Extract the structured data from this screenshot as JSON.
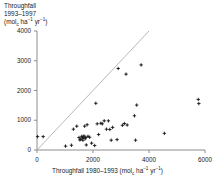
{
  "figure": {
    "name": "throughfall-scatter-plot",
    "background": "#ffffff",
    "axis_color": "#8c8c8c",
    "point_color": "#1a1a1a",
    "line_color": "#b0b0b0"
  },
  "labels": {
    "y_axis_line1": "Throughfall",
    "y_axis_line2": "1993–1997",
    "y_axis_units_pre": "(mol",
    "y_axis_units_sub": "c",
    "y_axis_units_mid": " ha",
    "y_axis_units_sup1": "−1",
    "y_axis_units_mid2": " yr",
    "y_axis_units_sup2": "−1",
    "y_axis_units_post": ")",
    "x_axis_pre": "Throughfall 1980–1993 (mol",
    "x_axis_sub": "c",
    "x_axis_mid": " ha",
    "x_axis_sup1": "−1",
    "x_axis_mid2": " yr",
    "x_axis_sup2": "−1",
    "x_axis_post": ")"
  },
  "ticks": {
    "y": [
      "0",
      "1000",
      "2000",
      "3000",
      "4000"
    ],
    "x": [
      "0",
      "2000",
      "4000",
      "6000"
    ]
  },
  "chart_data": {
    "type": "scatter",
    "title": "",
    "xlabel": "Throughfall 1980–1993 (mol_c ha^-1 yr^-1)",
    "ylabel": "Throughfall 1993–1997 (mol_c ha^-1 yr^-1)",
    "xlim": [
      0,
      6000
    ],
    "ylim": [
      0,
      4000
    ],
    "xticks": [
      0,
      2000,
      4000,
      6000
    ],
    "yticks": [
      0,
      1000,
      2000,
      3000,
      4000
    ],
    "grid": false,
    "legend": false,
    "reference_line": {
      "name": "one-to-one-line",
      "type": "identity",
      "from": [
        0,
        0
      ],
      "to": [
        4000,
        4000
      ]
    },
    "series": [
      {
        "name": "plots",
        "marker": "plus",
        "color": "#1a1a1a",
        "points": [
          [
            20,
            450
          ],
          [
            220,
            450
          ],
          [
            1020,
            130
          ],
          [
            1230,
            160
          ],
          [
            1300,
            700
          ],
          [
            1420,
            800
          ],
          [
            1500,
            420
          ],
          [
            1530,
            340
          ],
          [
            1560,
            360
          ],
          [
            1600,
            460
          ],
          [
            1620,
            400
          ],
          [
            1640,
            330
          ],
          [
            1660,
            430
          ],
          [
            1680,
            470
          ],
          [
            1700,
            800
          ],
          [
            1720,
            380
          ],
          [
            1740,
            420
          ],
          [
            1760,
            170
          ],
          [
            1790,
            850
          ],
          [
            1820,
            460
          ],
          [
            1880,
            430
          ],
          [
            1950,
            230
          ],
          [
            2060,
            150
          ],
          [
            2100,
            1570
          ],
          [
            2150,
            880
          ],
          [
            2200,
            520
          ],
          [
            2280,
            900
          ],
          [
            2330,
            880
          ],
          [
            2400,
            980
          ],
          [
            2480,
            700
          ],
          [
            2550,
            980
          ],
          [
            2600,
            690
          ],
          [
            2650,
            330
          ],
          [
            2700,
            760
          ],
          [
            2860,
            350
          ],
          [
            2900,
            2740
          ],
          [
            3050,
            830
          ],
          [
            3120,
            890
          ],
          [
            3180,
            2550
          ],
          [
            3220,
            840
          ],
          [
            3480,
            1150
          ],
          [
            3520,
            330
          ],
          [
            3560,
            1510
          ],
          [
            3720,
            2860
          ],
          [
            4550,
            560
          ],
          [
            5760,
            1700
          ],
          [
            5780,
            1560
          ]
        ]
      }
    ]
  }
}
